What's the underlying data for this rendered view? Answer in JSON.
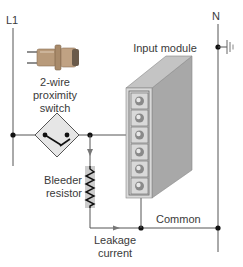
{
  "diagram": {
    "labels": {
      "l1": "L1",
      "n": "N",
      "switch_line1": "2-wire",
      "switch_line2": "proximity",
      "switch_line3": "switch",
      "module": "Input module",
      "bleeder_line1": "Bleeder",
      "bleeder_line2": "resistor",
      "common": "Common",
      "leakage_line1": "Leakage",
      "leakage_line2": "current"
    },
    "module": {
      "terminal_count": 6,
      "connected_input_terminal": 3,
      "common_terminal": 6
    },
    "colors": {
      "wire": "#555555",
      "module_front": "#d9d9d9",
      "module_side": "#a8a8a8",
      "module_top": "#c4c4c4",
      "resistor_fill": "#cccccc",
      "diamond_fill": "#e6e6e6"
    }
  }
}
